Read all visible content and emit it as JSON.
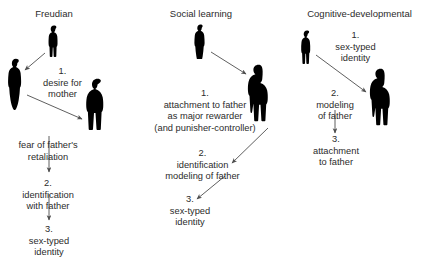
{
  "diagram": {
    "columns": [
      {
        "id": "freudian",
        "title": "Freudian",
        "steps": [
          {
            "number": "1.",
            "text": "1.\ndesire for\nmother"
          },
          {
            "number": "",
            "text": "fear of father's\nretaliation"
          },
          {
            "number": "2.",
            "text": "2.\nidentification\nwith father"
          },
          {
            "number": "3.",
            "text": "3.\nsex-typed\nidentity"
          }
        ],
        "figures": [
          {
            "name": "father-figure",
            "type": "adult-male"
          },
          {
            "name": "mother-figure",
            "type": "adult-female"
          },
          {
            "name": "child-figure",
            "type": "child"
          }
        ]
      },
      {
        "id": "social-learning",
        "title": "Social learning",
        "steps": [
          {
            "number": "1.",
            "text": "1.\nattachment to father\nas major rewarder\n(and punisher-controller)"
          },
          {
            "number": "2.",
            "text": "2.\nidentification\nmodeling of father"
          },
          {
            "number": "3.",
            "text": "3.\nsex-typed\nidentity"
          }
        ],
        "figures": [
          {
            "name": "mother-figure",
            "type": "adult-female"
          },
          {
            "name": "father-figure",
            "type": "adult-male"
          }
        ]
      },
      {
        "id": "cognitive-developmental",
        "title": "Cognitive-developmental",
        "steps": [
          {
            "number": "1.",
            "text": "1.\nsex-typed\nidentity"
          },
          {
            "number": "2.",
            "text": "2.\nmodeling\nof father"
          },
          {
            "number": "3.",
            "text": "3.\nattachment\nto father"
          }
        ],
        "figures": [
          {
            "name": "child-figure",
            "type": "child"
          },
          {
            "name": "father-figure",
            "type": "adult-male"
          }
        ]
      }
    ],
    "colors": {
      "text": "#2b2b2b",
      "figure": "#000000",
      "arrow": "#4d4d4d",
      "background": "#ffffff"
    }
  }
}
